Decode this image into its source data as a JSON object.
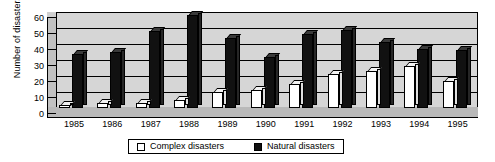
{
  "chart_data": {
    "type": "bar",
    "title": "",
    "xlabel": "",
    "ylabel": "Number of disasters",
    "ylim": [
      0,
      60
    ],
    "yticks": [
      0,
      10,
      20,
      30,
      40,
      50,
      60
    ],
    "grid": true,
    "legend_position": "bottom",
    "categories": [
      "1985",
      "1986",
      "1987",
      "1988",
      "1989",
      "1990",
      "1991",
      "1992",
      "1993",
      "1994",
      "1995"
    ],
    "series": [
      {
        "name": "Complex disasters",
        "color": "#ffffff",
        "values": [
          2,
          3,
          3,
          5,
          10,
          11,
          15,
          21,
          23,
          26,
          17
        ]
      },
      {
        "name": "Natural disasters",
        "color": "#111111",
        "values": [
          34,
          35,
          48,
          58,
          44,
          32,
          46,
          49,
          41,
          37,
          36
        ]
      }
    ]
  },
  "legend": {
    "items": [
      {
        "label": "Complex disasters",
        "swatch": "white-square-icon"
      },
      {
        "label": "Natural disasters",
        "swatch": "black-square-icon"
      }
    ]
  }
}
